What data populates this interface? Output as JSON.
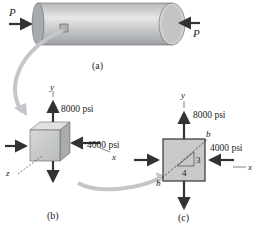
{
  "diagram": {
    "part_a": {
      "caption": "(a)",
      "load_left": "P",
      "load_right": "P"
    },
    "part_b": {
      "caption": "(b)",
      "axis_y": "y",
      "axis_x": "x",
      "axis_z": "z",
      "stress_y": "8000 psi",
      "stress_x": "4000 psi"
    },
    "part_c": {
      "caption": "(c)",
      "axis_y": "y",
      "axis_x": "x",
      "stress_y": "8000 psi",
      "stress_x": "4000 psi",
      "plane_label_top": "b",
      "plane_label_bottom": "b",
      "slope_rise": "3",
      "slope_run": "4"
    },
    "colors": {
      "element_fill": "#c7c9cb",
      "arrow": "#333333",
      "callout_arrow": "#b9bcbf"
    }
  }
}
